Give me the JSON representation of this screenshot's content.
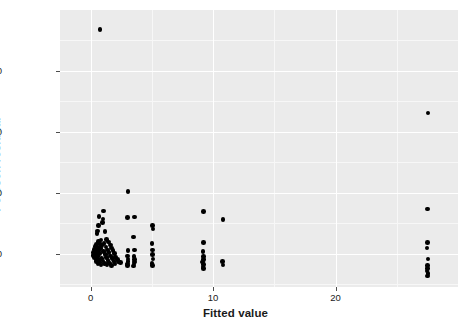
{
  "chart_data": {
    "type": "scatter",
    "title": "",
    "xlabel": "Fitted value",
    "ylabel": "Pearson residual",
    "xlim": [
      -2.5,
      30.0
    ],
    "ylim": [
      -5.5,
      40.0
    ],
    "xticks": [
      0,
      10,
      20
    ],
    "yticks": [
      0,
      10,
      20,
      30
    ],
    "xtick_labels": [
      "0",
      "10",
      "20"
    ],
    "ytick_labels": [
      "0",
      "10",
      "20",
      "30"
    ],
    "grid": true,
    "grid_major_color": "#ffffff",
    "grid_minor_color": "#f7f7f7",
    "panel_color": "#ebebeb",
    "point_color": "#000000",
    "legend": "none",
    "points": [
      [
        0.76,
        36.8
      ],
      [
        3.05,
        10.2
      ],
      [
        1.05,
        7.0
      ],
      [
        0.7,
        6.1
      ],
      [
        1.0,
        5.7
      ],
      [
        0.95,
        5.1
      ],
      [
        0.62,
        4.6
      ],
      [
        0.58,
        3.7
      ],
      [
        1.18,
        3.6
      ],
      [
        0.52,
        3.3
      ],
      [
        1.3,
        2.3
      ],
      [
        0.86,
        2.2
      ],
      [
        0.66,
        2.0
      ],
      [
        1.45,
        1.9
      ],
      [
        0.74,
        1.7
      ],
      [
        1.1,
        1.6
      ],
      [
        0.48,
        1.5
      ],
      [
        1.62,
        1.4
      ],
      [
        0.9,
        1.3
      ],
      [
        0.4,
        1.2
      ],
      [
        1.26,
        1.1
      ],
      [
        0.58,
        1.0
      ],
      [
        1.7,
        0.9
      ],
      [
        0.8,
        0.8
      ],
      [
        0.33,
        0.7
      ],
      [
        1.38,
        0.6
      ],
      [
        0.66,
        0.5
      ],
      [
        1.82,
        0.45
      ],
      [
        0.45,
        0.35
      ],
      [
        1.05,
        0.3
      ],
      [
        0.25,
        0.2
      ],
      [
        1.5,
        0.15
      ],
      [
        0.72,
        0.05
      ],
      [
        1.95,
        0.0
      ],
      [
        0.38,
        -0.1
      ],
      [
        1.22,
        -0.2
      ],
      [
        0.18,
        -0.3
      ],
      [
        1.64,
        -0.4
      ],
      [
        0.55,
        -0.5
      ],
      [
        2.05,
        -0.55
      ],
      [
        0.3,
        -0.65
      ],
      [
        1.32,
        -0.7
      ],
      [
        0.88,
        -0.8
      ],
      [
        1.78,
        -0.85
      ],
      [
        0.44,
        -0.95
      ],
      [
        2.18,
        -1.0
      ],
      [
        0.62,
        -1.05
      ],
      [
        1.42,
        -1.15
      ],
      [
        1.0,
        -1.2
      ],
      [
        1.9,
        -1.3
      ],
      [
        0.5,
        -1.35
      ],
      [
        2.3,
        -1.4
      ],
      [
        0.72,
        -1.5
      ],
      [
        1.55,
        -1.55
      ],
      [
        1.12,
        -1.6
      ],
      [
        2.0,
        -1.7
      ],
      [
        0.6,
        -1.75
      ],
      [
        1.35,
        -1.85
      ],
      [
        0.85,
        -1.9
      ],
      [
        1.72,
        -1.95
      ],
      [
        2.42,
        -1.5
      ],
      [
        3.0,
        5.9
      ],
      [
        3.58,
        6.0
      ],
      [
        3.52,
        2.7
      ],
      [
        3.05,
        0.5
      ],
      [
        3.6,
        0.6
      ],
      [
        3.02,
        -0.4
      ],
      [
        3.55,
        -0.5
      ],
      [
        3.04,
        -0.9
      ],
      [
        3.58,
        -1.0
      ],
      [
        3.06,
        -1.3
      ],
      [
        3.56,
        -1.4
      ],
      [
        3.02,
        -1.7
      ],
      [
        3.54,
        -1.75
      ],
      [
        3.0,
        -2.0
      ],
      [
        3.52,
        -2.05
      ],
      [
        5.05,
        4.6
      ],
      [
        5.08,
        4.0
      ],
      [
        5.02,
        1.6
      ],
      [
        5.06,
        0.6
      ],
      [
        5.04,
        -0.2
      ],
      [
        5.08,
        -0.9
      ],
      [
        5.02,
        -1.6
      ],
      [
        5.06,
        -2.0
      ],
      [
        9.2,
        6.9
      ],
      [
        9.22,
        1.8
      ],
      [
        9.18,
        0.3
      ],
      [
        9.24,
        -0.5
      ],
      [
        9.2,
        -1.0
      ],
      [
        9.16,
        -1.4
      ],
      [
        9.22,
        -1.8
      ],
      [
        9.18,
        -2.2
      ],
      [
        9.24,
        -2.5
      ],
      [
        10.8,
        5.6
      ],
      [
        10.78,
        -1.3
      ],
      [
        10.82,
        -1.9
      ],
      [
        27.55,
        23.1
      ],
      [
        27.5,
        7.3
      ],
      [
        27.52,
        1.8
      ],
      [
        27.48,
        0.9
      ],
      [
        27.54,
        -0.9
      ],
      [
        27.5,
        -2.0
      ],
      [
        27.52,
        -2.5
      ],
      [
        27.48,
        -2.9
      ],
      [
        27.54,
        -3.3
      ],
      [
        27.5,
        -3.7
      ]
    ]
  },
  "axes": {
    "x_title": "Fitted value",
    "y_title": "Pearson residual"
  }
}
